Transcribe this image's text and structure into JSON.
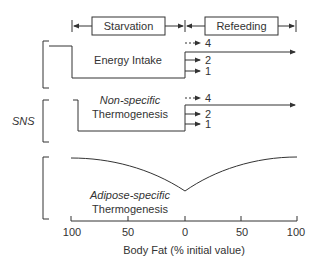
{
  "phases": {
    "starvation": "Starvation",
    "refeeding": "Refeeding"
  },
  "panels": {
    "energy_intake": {
      "title": "Energy Intake",
      "outcomes": [
        "4",
        "2",
        "1"
      ]
    },
    "nonspecific": {
      "title_line1": "Non-specific",
      "title_line2": "Thermogenesis",
      "outcomes": [
        "4",
        "2",
        "1"
      ]
    },
    "adipose": {
      "title_line1": "Adipose-specific",
      "title_line2": "Thermogenesis"
    }
  },
  "side_label": "SNS",
  "axis": {
    "label": "Body Fat (% initial value)",
    "ticks": [
      "100",
      "50",
      "0",
      "50",
      "100"
    ]
  }
}
